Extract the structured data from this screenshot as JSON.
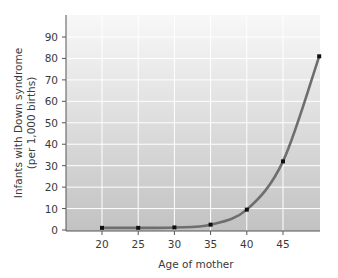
{
  "chart_data": {
    "type": "line",
    "title": "",
    "xlabel": "Age of mother",
    "ylabel_line1": "Infants with Down syndrome",
    "ylabel_line2": "(per 1,000 births)",
    "x_ticks": [
      20,
      25,
      30,
      35,
      40,
      45
    ],
    "y_ticks": [
      0,
      10,
      20,
      30,
      40,
      50,
      60,
      70,
      80,
      90
    ],
    "xlim": [
      15.5,
      50
    ],
    "ylim": [
      0,
      98
    ],
    "grid": true,
    "legend": null,
    "series": [
      {
        "name": "Infants with Down syndrome per 1,000 births",
        "x": [
          20,
          25,
          30,
          35,
          40,
          45,
          50
        ],
        "values": [
          1,
          1,
          1.2,
          2.5,
          9.5,
          32,
          81
        ]
      }
    ]
  },
  "colors": {
    "plot_bg_top": "#f7f7f7",
    "plot_bg_bottom": "#c2c2c2",
    "grid": "#ffffff",
    "line": "#6e6e6e",
    "marker": "#111111",
    "axis": "#555555"
  }
}
